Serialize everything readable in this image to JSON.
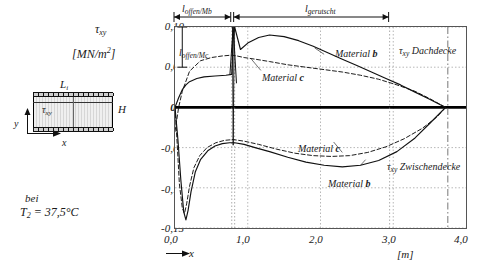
{
  "left_panel": {
    "tau_symbol": "τ",
    "tau_subscript": "xy",
    "unit_label_text": "[MN/m",
    "unit_label_sup": "2",
    "unit_label_tail": "]",
    "diagram": {
      "length_label": "L",
      "length_sub": "i",
      "height_label": "H",
      "stress_label": "τ",
      "stress_sub": "xy",
      "y_axis_label": "y",
      "x_axis_label": "x"
    },
    "condition_line1": "bei",
    "condition_line2_pre": "T",
    "condition_line2_sub": "2",
    "condition_line2_post": " = 37,5°C"
  },
  "plot": {
    "dimension_offen_mb": "l",
    "dimension_offen_mb_sub": "offen/Mb",
    "dimension_gerutscht": "l",
    "dimension_gerutscht_sub": "gerutscht",
    "dimension_offen_mc": "l",
    "dimension_offen_mc_sub": "offen/Mc",
    "annotation_material_b_top": "Material",
    "annotation_material_b_top_bold": "b",
    "annotation_material_c_top": "Material",
    "annotation_material_c_top_bold": "c",
    "annotation_material_c_bottom": "Material",
    "annotation_material_c_bottom_bold": "c",
    "annotation_material_b_bottom": "Material",
    "annotation_material_b_bottom_bold": "b",
    "annotation_dachdecke": "τ",
    "annotation_dachdecke_sub": "xy",
    "annotation_dachdecke_text": " Dachdecke",
    "annotation_zwischendecke": "τ",
    "annotation_zwischendecke_sub": "xy",
    "annotation_zwischendecke_text": " Zwischendecke",
    "x_unit": "[m]",
    "x_axis_name": "x"
  },
  "chart_data": {
    "type": "line",
    "title": "",
    "xlabel": "x",
    "ylabel": "τxy",
    "x_unit": "[m]",
    "y_unit": "[MN/m²]",
    "xlim": [
      0.0,
      4.0
    ],
    "ylim": [
      -0.15,
      0.1
    ],
    "xticks": [
      "0,0",
      "1,0",
      "2,0",
      "3,0",
      "4,0"
    ],
    "xtick_values": [
      0.0,
      1.0,
      2.0,
      3.0,
      4.0
    ],
    "yticks": [
      "0,10",
      "0,05",
      "0,0",
      "-0,05",
      "-0,10",
      "-0,15"
    ],
    "ytick_values": [
      0.1,
      0.05,
      0.0,
      -0.05,
      -0.1,
      -0.15
    ],
    "grid": true,
    "legend": "annotations-inline",
    "zero_line": true,
    "markers": {
      "l_offen_Mb_range": [
        0.0,
        0.78
      ],
      "l_gerutscht_range": [
        0.82,
        2.95
      ],
      "l_offen_Mc_range_y": [
        0.05,
        0.1
      ],
      "vertical_dashdot_x": 3.75,
      "convergence_x": 3.72
    },
    "series": [
      {
        "name": "Material b Dachdecke",
        "style": "solid",
        "region": "Dachdecke",
        "x": [
          0.0,
          0.05,
          0.1,
          0.15,
          0.2,
          0.3,
          0.4,
          0.55,
          0.7,
          0.78,
          0.8,
          0.82,
          0.9,
          1.0,
          1.15,
          1.3,
          1.5,
          1.7,
          1.9,
          2.1,
          2.3,
          2.5,
          2.7,
          2.9,
          3.1,
          3.3,
          3.5,
          3.72
        ],
        "y": [
          0.0,
          0.012,
          0.022,
          0.028,
          0.032,
          0.036,
          0.038,
          0.039,
          0.04,
          0.041,
          0.085,
          0.1,
          0.072,
          0.08,
          0.087,
          0.09,
          0.088,
          0.083,
          0.076,
          0.068,
          0.06,
          0.052,
          0.044,
          0.036,
          0.028,
          0.019,
          0.01,
          0.0
        ]
      },
      {
        "name": "Material c Dachdecke",
        "style": "dashed",
        "region": "Dachdecke",
        "x": [
          0.0,
          0.05,
          0.1,
          0.2,
          0.35,
          0.5,
          0.65,
          0.78,
          0.85,
          0.95,
          1.1,
          1.3,
          1.55,
          1.8,
          2.05,
          2.3,
          2.55,
          2.8,
          3.05,
          3.3,
          3.5,
          3.72
        ],
        "y": [
          -0.03,
          0.0,
          0.02,
          0.045,
          0.058,
          0.062,
          0.064,
          0.065,
          0.064,
          0.062,
          0.06,
          0.057,
          0.053,
          0.05,
          0.047,
          0.044,
          0.04,
          0.035,
          0.028,
          0.02,
          0.011,
          0.0
        ]
      },
      {
        "name": "Material b Zwischendecke",
        "style": "solid",
        "region": "Zwischendecke",
        "x": [
          0.0,
          0.04,
          0.08,
          0.12,
          0.15,
          0.18,
          0.22,
          0.28,
          0.35,
          0.45,
          0.55,
          0.65,
          0.75,
          0.82,
          0.95,
          1.1,
          1.3,
          1.55,
          1.8,
          2.05,
          2.3,
          2.55,
          2.8,
          3.05,
          3.3,
          3.5,
          3.72
        ],
        "y": [
          0.0,
          -0.04,
          -0.09,
          -0.13,
          -0.14,
          -0.128,
          -0.105,
          -0.08,
          -0.065,
          -0.054,
          -0.048,
          -0.045,
          -0.044,
          -0.044,
          -0.046,
          -0.05,
          -0.055,
          -0.062,
          -0.068,
          -0.072,
          -0.074,
          -0.072,
          -0.066,
          -0.055,
          -0.038,
          -0.02,
          0.0
        ]
      },
      {
        "name": "Material c Zwischendecke",
        "style": "dashed",
        "region": "Zwischendecke",
        "x": [
          0.0,
          0.03,
          0.06,
          0.1,
          0.13,
          0.16,
          0.2,
          0.26,
          0.34,
          0.44,
          0.56,
          0.68,
          0.8,
          0.95,
          1.15,
          1.4,
          1.65,
          1.9,
          2.15,
          2.4,
          2.65,
          2.9,
          3.15,
          3.4,
          3.6,
          3.72
        ],
        "y": [
          0.0,
          -0.045,
          -0.095,
          -0.125,
          -0.132,
          -0.12,
          -0.098,
          -0.075,
          -0.06,
          -0.05,
          -0.044,
          -0.041,
          -0.04,
          -0.042,
          -0.046,
          -0.052,
          -0.057,
          -0.06,
          -0.061,
          -0.06,
          -0.056,
          -0.049,
          -0.039,
          -0.026,
          -0.012,
          0.0
        ]
      }
    ]
  }
}
